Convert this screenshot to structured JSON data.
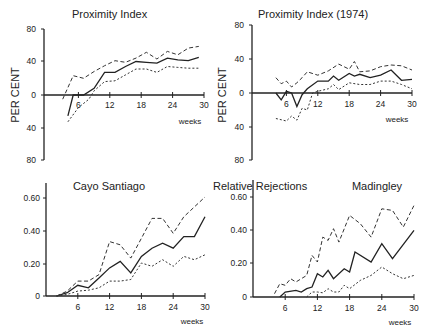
{
  "labels": {
    "per_cent": "PER CENT",
    "weeks": "weeks",
    "relative_rejections": "Relative Rejections"
  },
  "chart_data": [
    {
      "type": "line",
      "title": "Proximity Index",
      "xlabel": "weeks",
      "ylabel": "PER CENT",
      "xlim": [
        0,
        30
      ],
      "ylim": [
        -80,
        80
      ],
      "x_ticks": [
        "6",
        "12",
        "18",
        "24",
        "30"
      ],
      "y_ticks": [
        "80",
        "40",
        "0",
        "40",
        "80"
      ],
      "series": [
        {
          "name": "median",
          "style": "solid",
          "x": [
            4,
            5,
            7,
            9,
            11,
            13,
            15,
            17,
            19,
            21,
            23,
            25,
            27,
            29
          ],
          "y": [
            -25,
            0,
            0,
            8,
            27,
            27,
            34,
            40,
            39,
            38,
            44,
            42,
            41,
            45
          ]
        },
        {
          "name": "upper",
          "style": "dashed",
          "x": [
            3,
            5,
            7,
            9,
            11,
            13,
            15,
            17,
            19,
            21,
            23,
            25,
            27,
            29
          ],
          "y": [
            -5,
            23,
            20,
            28,
            35,
            41,
            39,
            44,
            51,
            43,
            52,
            48,
            56,
            58
          ]
        },
        {
          "name": "lower",
          "style": "dotted",
          "x": [
            4,
            6,
            8,
            9,
            11,
            13,
            15,
            17,
            19,
            21,
            23,
            25,
            27,
            29
          ],
          "y": [
            -32,
            -15,
            -5,
            5,
            16,
            17,
            24,
            31,
            31,
            27,
            34,
            33,
            32,
            32
          ]
        }
      ]
    },
    {
      "type": "line",
      "title": "Proximity Index (1974)",
      "xlabel": "weeks",
      "ylabel": "PER CENT",
      "xlim": [
        0,
        30
      ],
      "ylim": [
        -80,
        80
      ],
      "x_ticks": [
        "6",
        "12",
        "18",
        "24",
        "30"
      ],
      "y_ticks": [
        "80",
        "40",
        "0",
        "40",
        "80"
      ],
      "series": [
        {
          "name": "median",
          "style": "solid",
          "x": [
            4,
            5,
            6,
            7,
            8,
            9,
            10,
            12,
            14,
            15,
            16,
            18,
            19,
            20,
            22,
            24,
            26,
            28,
            30
          ],
          "y": [
            0,
            -8,
            2,
            0,
            -16,
            -2,
            5,
            14,
            14,
            20,
            15,
            23,
            20,
            22,
            18,
            21,
            27,
            15,
            16
          ]
        },
        {
          "name": "upper",
          "style": "dashed",
          "x": [
            4,
            5,
            6,
            7,
            8,
            9,
            10,
            12,
            14,
            16,
            18,
            19,
            20,
            22,
            24,
            26,
            28,
            30
          ],
          "y": [
            18,
            11,
            14,
            7,
            12,
            18,
            25,
            21,
            26,
            34,
            28,
            37,
            25,
            26,
            31,
            33,
            32,
            27
          ]
        },
        {
          "name": "lower",
          "style": "dotted",
          "x": [
            4,
            6,
            7,
            8,
            9,
            10,
            11,
            12,
            14,
            15,
            16,
            18,
            20,
            22,
            24,
            26,
            28,
            30
          ],
          "y": [
            -30,
            -33,
            -27,
            -32,
            -18,
            -20,
            0,
            2,
            5,
            10,
            4,
            12,
            10,
            10,
            14,
            14,
            10,
            5
          ]
        }
      ]
    },
    {
      "type": "line",
      "title": "Cayo Santiago",
      "xlabel": "weeks",
      "ylabel": "Relative Rejections",
      "xlim": [
        0,
        30
      ],
      "ylim": [
        0,
        0.7
      ],
      "x_ticks": [
        "6",
        "12",
        "18",
        "24",
        "30"
      ],
      "y_ticks": [
        "0.60",
        "0.40",
        "0.20",
        "0"
      ],
      "series": [
        {
          "name": "median",
          "style": "solid",
          "x": [
            2,
            4,
            6,
            8,
            10,
            12,
            14,
            16,
            18,
            20,
            22,
            24,
            26,
            28,
            30
          ],
          "y": [
            0,
            0.02,
            0.065,
            0.05,
            0.11,
            0.17,
            0.21,
            0.14,
            0.24,
            0.29,
            0.32,
            0.29,
            0.36,
            0.36,
            0.48
          ]
        },
        {
          "name": "upper",
          "style": "dashed",
          "x": [
            2,
            4,
            6,
            8,
            10,
            12,
            14,
            16,
            18,
            20,
            22,
            24,
            26,
            28,
            30
          ],
          "y": [
            0,
            0.03,
            0.09,
            0.09,
            0.13,
            0.33,
            0.31,
            0.23,
            0.35,
            0.47,
            0.47,
            0.38,
            0.48,
            0.54,
            0.6
          ]
        },
        {
          "name": "lower",
          "style": "dotted",
          "x": [
            2,
            4,
            6,
            8,
            10,
            12,
            14,
            16,
            18,
            20,
            22,
            24,
            26,
            28,
            30
          ],
          "y": [
            0,
            0.01,
            0.03,
            0.035,
            0.05,
            0.09,
            0.09,
            0.1,
            0.2,
            0.18,
            0.22,
            0.18,
            0.24,
            0.22,
            0.25
          ]
        }
      ]
    },
    {
      "type": "line",
      "title": "Madingley",
      "xlabel": "weeks",
      "ylabel": "Relative Rejections",
      "xlim": [
        0,
        30
      ],
      "ylim": [
        0,
        0.7
      ],
      "x_ticks": [
        "6",
        "12",
        "18",
        "24",
        "30"
      ],
      "y_ticks": [
        "0.60",
        "0.40",
        "0.20",
        "0"
      ],
      "series": [
        {
          "name": "median",
          "style": "solid",
          "x": [
            5,
            6,
            8,
            9,
            10,
            11,
            12,
            13,
            14,
            15,
            17,
            18,
            19,
            22,
            24,
            26,
            30
          ],
          "y": [
            0,
            0.03,
            0.04,
            0.03,
            0.05,
            0.06,
            0.14,
            0.12,
            0.16,
            0.11,
            0.17,
            0.15,
            0.27,
            0.21,
            0.32,
            0.23,
            0.4
          ]
        },
        {
          "name": "upper",
          "style": "dashed",
          "x": [
            4,
            5,
            6,
            7,
            8,
            10,
            11,
            12,
            13,
            14,
            15,
            16,
            18,
            20,
            22,
            24,
            26,
            28,
            30
          ],
          "y": [
            0.02,
            0.08,
            0.07,
            0.11,
            0.09,
            0.13,
            0.25,
            0.21,
            0.36,
            0.34,
            0.41,
            0.33,
            0.49,
            0.44,
            0.36,
            0.53,
            0.52,
            0.42,
            0.55
          ]
        },
        {
          "name": "lower",
          "style": "dotted",
          "x": [
            10,
            11,
            12,
            13,
            14,
            15,
            16,
            17,
            18,
            20,
            22,
            24,
            26,
            28,
            30
          ],
          "y": [
            0,
            0.03,
            0.03,
            0.025,
            0.05,
            0.03,
            0.03,
            0.07,
            0.05,
            0.1,
            0.13,
            0.18,
            0.14,
            0.11,
            0.13
          ]
        }
      ]
    }
  ]
}
